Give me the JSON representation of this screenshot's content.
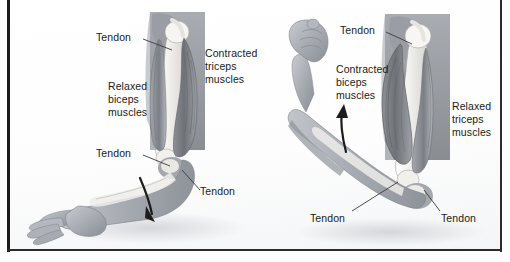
{
  "figure": {
    "background_color": "#fdfdfd",
    "frame_color": "#1c1c1c",
    "text_color": "#1a1a1a"
  },
  "panels": [
    {
      "id": "extended-arm",
      "name": "Arm extended (straightening)",
      "arrow_direction": "downward",
      "labels": [
        {
          "id": "tendon-upper-left",
          "text": "Tendon"
        },
        {
          "id": "relaxed-biceps",
          "text": "Relaxed\nbiceps\nmuscles"
        },
        {
          "id": "contracted-triceps",
          "text": "Contracted\ntriceps\nmuscles"
        },
        {
          "id": "tendon-elbow-left",
          "text": "Tendon"
        },
        {
          "id": "tendon-lower-right",
          "text": "Tendon"
        }
      ]
    },
    {
      "id": "flexed-arm",
      "name": "Arm flexed (bending)",
      "arrow_direction": "upward",
      "labels": [
        {
          "id": "tendon-upper-right",
          "text": "Tendon"
        },
        {
          "id": "contracted-biceps",
          "text": "Contracted\nbiceps\nmuscles"
        },
        {
          "id": "relaxed-triceps",
          "text": "Relaxed\ntriceps\nmuscles"
        },
        {
          "id": "tendon-bottom-left",
          "text": "Tendon"
        },
        {
          "id": "tendon-bottom-right",
          "text": "Tendon"
        }
      ]
    }
  ],
  "colors": {
    "muscle_dark": "#6f7175",
    "muscle_mid": "#90939a",
    "muscle_light": "#b8bcc2",
    "bone": "#f0efed",
    "skin": "#a9adb4",
    "arrow": "#1c1c1c"
  }
}
